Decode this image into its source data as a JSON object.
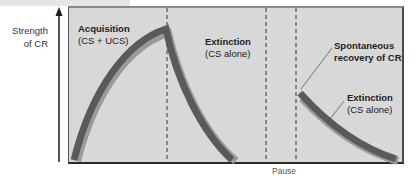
{
  "diagram": {
    "y_axis_label_line1": "Strength",
    "y_axis_label_line2": "of CR",
    "x_axis_annotation": "Pause",
    "phases": [
      {
        "title": "Acquisition",
        "subtitle": "(CS + UCS)"
      },
      {
        "title": "Extinction",
        "subtitle": "(CS alone)"
      },
      {
        "title": "Spontaneous",
        "subtitle": "recovery of CR"
      },
      {
        "title": "Extinction",
        "subtitle": "(CS alone)"
      }
    ],
    "colors": {
      "panel_fill": "#d8d8d8",
      "curve": "#5a5a5a",
      "curve_shadow": "#9a9a9a",
      "axis": "#1a1a1a",
      "dashed_line": "#333333"
    }
  }
}
